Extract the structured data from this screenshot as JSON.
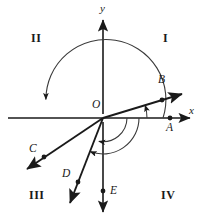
{
  "figure": {
    "colors": {
      "stroke": "#1a1a1a",
      "arc": "#3a3a3a",
      "background": "#ffffff"
    },
    "origin": {
      "label": "O",
      "x": 103,
      "y": 118
    },
    "axes": [
      {
        "name": "x-axis",
        "label": "x",
        "label_x": 189,
        "label_y": 111
      },
      {
        "name": "y-axis",
        "label": "y",
        "label_x": 100,
        "label_y": 6
      }
    ],
    "quadrants": [
      {
        "id": "quadrant-one",
        "label": "I",
        "x": 163,
        "y": 38
      },
      {
        "id": "quadrant-two",
        "label": "II",
        "x": 33,
        "y": 38
      },
      {
        "id": "quadrant-three",
        "label": "III",
        "x": 31,
        "y": 193
      },
      {
        "id": "quadrant-four",
        "label": "IV",
        "x": 161,
        "y": 193
      }
    ],
    "points": [
      {
        "id": "point-a",
        "label": "A",
        "dot_x": 170,
        "dot_y": 118,
        "label_x": 166,
        "label_y": 124
      },
      {
        "id": "point-b",
        "label": "B",
        "dot_x": 162,
        "dot_y": 90,
        "label_x": 159,
        "label_y": 75
      },
      {
        "id": "point-c",
        "label": "C",
        "dot_x": 44,
        "dot_y": 157,
        "label_x": 31,
        "label_y": 147
      },
      {
        "id": "point-d",
        "label": "D",
        "dot_x": 74,
        "dot_y": 188,
        "label_x": 63,
        "label_y": 172
      },
      {
        "id": "point-e",
        "label": "E",
        "dot_x": 103,
        "dot_y": 191,
        "label_x": 109,
        "label_y": 186
      }
    ],
    "rays": [
      {
        "id": "ray-ob",
        "through": "B",
        "direction_deg": 17,
        "arrow": "end"
      },
      {
        "id": "ray-oc",
        "through": "C",
        "direction_deg": 198,
        "arrow": "end"
      },
      {
        "id": "ray-od",
        "through": "D",
        "direction_deg": 249,
        "arrow": "end"
      }
    ],
    "arcs": [
      {
        "id": "arc-large-ccw",
        "radius": 60,
        "from_deg": 0,
        "to_deg": 198,
        "arrow": "end",
        "description": "large counterclockwise arc from positive x-axis to ray OC"
      },
      {
        "id": "arc-medium-cw",
        "radius": 36,
        "from_deg": 0,
        "to_deg": -111,
        "arrow": "end",
        "description": "arc from positive x-axis clockwise to ray OD"
      },
      {
        "id": "arc-small-cw",
        "radius": 24,
        "from_deg": 0,
        "to_deg": -162,
        "arrow": "end",
        "description": "arc from positive x-axis clockwise toward ray OC"
      },
      {
        "id": "arc-tiny-ob",
        "radius": 44,
        "from_deg": 0,
        "to_deg": 17,
        "arrow": "end",
        "description": "small arc from positive x-axis up to ray OB"
      }
    ]
  }
}
